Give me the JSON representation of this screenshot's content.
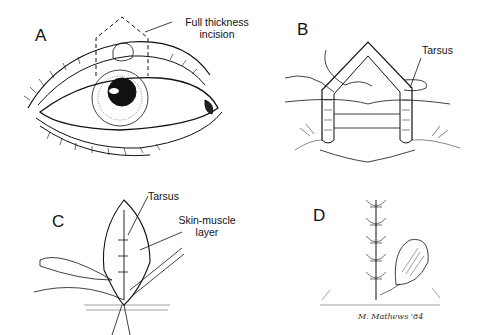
{
  "figure": {
    "panels": [
      {
        "id": "A",
        "letter": "A",
        "labels": [
          "Full thickness",
          "incision"
        ]
      },
      {
        "id": "B",
        "letter": "B",
        "labels": [
          "Tarsus"
        ]
      },
      {
        "id": "C",
        "letter": "C",
        "labels": [
          "Tarsus",
          "Skin-muscle",
          "layer"
        ]
      },
      {
        "id": "D",
        "letter": "D",
        "labels": []
      }
    ],
    "signature": "M. Mathews '84"
  }
}
